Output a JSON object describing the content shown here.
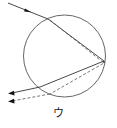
{
  "figure": {
    "label": "ウ",
    "type": "light ray path through a spherical droplet (refraction and internal reflection)",
    "colors": {
      "circle": "#555555",
      "solid_ray": "#333333",
      "dashed_ray": "#555555",
      "arrow": "#111111"
    },
    "droplet": {
      "cx": 64.5,
      "cy": 56,
      "r": 41
    },
    "rays": [
      {
        "name": "incident-ray",
        "style": "solid",
        "points": [
          [
            8,
            3
          ],
          [
            48,
            19
          ]
        ]
      },
      {
        "name": "refracted-solid-ray",
        "style": "solid",
        "points": [
          [
            48,
            19
          ],
          [
            104,
            61
          ],
          [
            40,
            87
          ],
          [
            10,
            93
          ]
        ]
      },
      {
        "name": "refracted-dashed-ray",
        "style": "dashed",
        "points": [
          [
            50,
            20
          ],
          [
            104,
            63
          ],
          [
            50,
            94
          ],
          [
            10,
            101
          ]
        ]
      }
    ]
  }
}
